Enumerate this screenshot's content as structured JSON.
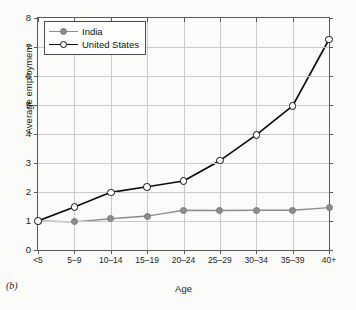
{
  "caption": "(b)",
  "chart_data": {
    "type": "line",
    "title": "",
    "xlabel": "Age",
    "ylabel": "Average employment",
    "categories": [
      "<5",
      "5–9",
      "10–14",
      "15–19",
      "20–24",
      "25–29",
      "30–34",
      "35–39",
      "40+"
    ],
    "ylim": [
      0,
      8
    ],
    "yticks": [
      0,
      1,
      2,
      3,
      4,
      5,
      6,
      7,
      8
    ],
    "ytick_labels": [
      "0",
      "1",
      "2",
      "3",
      "4",
      "5",
      "6",
      "7",
      "8"
    ],
    "grid": true,
    "legend_position": "top-left",
    "series": [
      {
        "name": "India",
        "color": "#8c8c8c",
        "marker": "filled-circle",
        "values": [
          1.0,
          0.97,
          1.08,
          1.17,
          1.37,
          1.36,
          1.37,
          1.37,
          1.46
        ]
      },
      {
        "name": "United States",
        "color": "#0d0d0d",
        "marker": "open-circle",
        "values": [
          1.0,
          1.48,
          1.99,
          2.18,
          2.38,
          3.08,
          3.97,
          4.97,
          7.26
        ]
      }
    ]
  }
}
